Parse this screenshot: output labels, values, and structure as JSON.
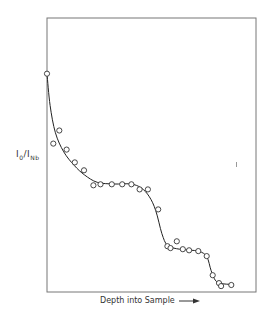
{
  "chart_data": {
    "type": "scatter",
    "title": "",
    "xlabel": "Depth into Sample",
    "ylabel": "I0/INb",
    "ylabel_parts": {
      "main": "I",
      "sub0": "0",
      "slash": "/I",
      "sub1": "Nb"
    },
    "x_ticks": [],
    "y_ticks": [],
    "grid": false,
    "legend": null,
    "xlim": [
      0,
      100
    ],
    "ylim": [
      0,
      100
    ],
    "points": [
      {
        "x": 0.0,
        "y": 79.6
      },
      {
        "x": 5.9,
        "y": 58.8
      },
      {
        "x": 3.0,
        "y": 54.0
      },
      {
        "x": 9.4,
        "y": 51.8
      },
      {
        "x": 13.3,
        "y": 47.1
      },
      {
        "x": 17.7,
        "y": 44.2
      },
      {
        "x": 22.2,
        "y": 38.7
      },
      {
        "x": 25.6,
        "y": 39.1
      },
      {
        "x": 31.0,
        "y": 39.1
      },
      {
        "x": 36.0,
        "y": 39.1
      },
      {
        "x": 40.4,
        "y": 39.1
      },
      {
        "x": 44.3,
        "y": 37.2
      },
      {
        "x": 48.3,
        "y": 37.2
      },
      {
        "x": 53.2,
        "y": 29.9
      },
      {
        "x": 57.6,
        "y": 16.4
      },
      {
        "x": 59.1,
        "y": 15.7
      },
      {
        "x": 62.1,
        "y": 18.2
      },
      {
        "x": 65.0,
        "y": 15.3
      },
      {
        "x": 68.0,
        "y": 14.9
      },
      {
        "x": 72.4,
        "y": 14.6
      },
      {
        "x": 76.4,
        "y": 12.8
      },
      {
        "x": 79.3,
        "y": 5.8
      },
      {
        "x": 82.3,
        "y": 2.9
      },
      {
        "x": 83.3,
        "y": 1.8
      },
      {
        "x": 88.2,
        "y": 2.2
      }
    ],
    "fit_curve": [
      {
        "x": 0.0,
        "y": 79.6
      },
      {
        "x": 1.5,
        "y": 68.0
      },
      {
        "x": 4.0,
        "y": 58.0
      },
      {
        "x": 8.0,
        "y": 51.0
      },
      {
        "x": 13.0,
        "y": 46.0
      },
      {
        "x": 18.0,
        "y": 42.5
      },
      {
        "x": 24.0,
        "y": 39.8
      },
      {
        "x": 32.0,
        "y": 39.2
      },
      {
        "x": 40.0,
        "y": 39.2
      },
      {
        "x": 45.0,
        "y": 37.8
      },
      {
        "x": 49.0,
        "y": 34.5
      },
      {
        "x": 52.0,
        "y": 29.5
      },
      {
        "x": 55.0,
        "y": 21.0
      },
      {
        "x": 57.5,
        "y": 16.8
      },
      {
        "x": 62.0,
        "y": 15.5
      },
      {
        "x": 68.0,
        "y": 15.0
      },
      {
        "x": 73.0,
        "y": 14.5
      },
      {
        "x": 76.5,
        "y": 12.5
      },
      {
        "x": 78.5,
        "y": 7.5
      },
      {
        "x": 80.5,
        "y": 4.0
      },
      {
        "x": 83.0,
        "y": 2.8
      },
      {
        "x": 88.2,
        "y": 2.4
      }
    ],
    "frame": {
      "left": 47,
      "top": 18,
      "right": 256,
      "bottom": 292
    },
    "colors": {
      "line": "#222222",
      "marker_edge": "#333333",
      "marker_fill": "#ffffff",
      "frame": "#777777"
    }
  }
}
